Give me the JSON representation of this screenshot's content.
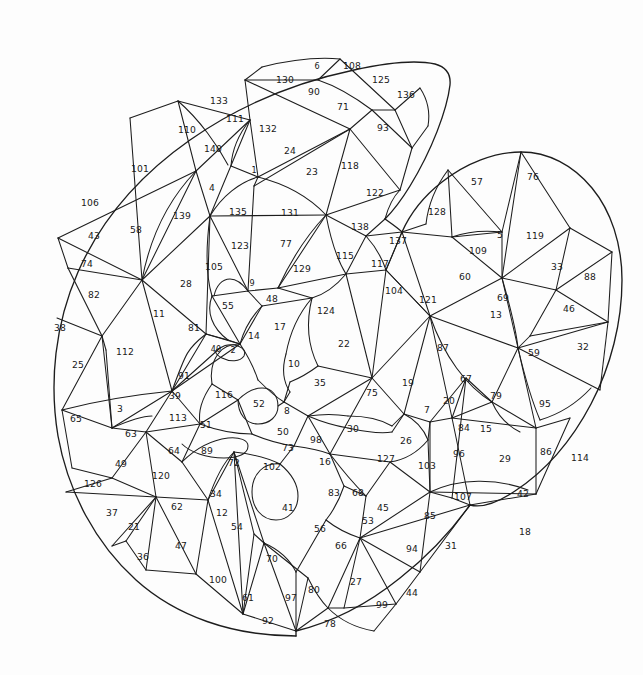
{
  "page": {
    "width": 643,
    "height": 675,
    "background_color": "#fdfdfd",
    "line_color": "#1d1d1d",
    "label_color": "#181818",
    "region_count": 140
  },
  "chart_data": {
    "type": "diagram",
    "xlabel": "",
    "ylabel": "",
    "grid": false,
    "legend": "none",
    "numbers_min": 1,
    "numbers_max": 140,
    "numbers_total": 140
  },
  "regions": [
    {
      "n": "6",
      "x": 317,
      "y": 66,
      "size": "sm"
    },
    {
      "n": "108",
      "x": 352,
      "y": 66,
      "size": ""
    },
    {
      "n": "130",
      "x": 285,
      "y": 80,
      "size": ""
    },
    {
      "n": "125",
      "x": 381,
      "y": 80,
      "size": ""
    },
    {
      "n": "90",
      "x": 314,
      "y": 92,
      "size": ""
    },
    {
      "n": "136",
      "x": 406,
      "y": 95,
      "size": ""
    },
    {
      "n": "133",
      "x": 219,
      "y": 101,
      "size": ""
    },
    {
      "n": "71",
      "x": 343,
      "y": 107,
      "size": ""
    },
    {
      "n": "111",
      "x": 235,
      "y": 119,
      "size": ""
    },
    {
      "n": "132",
      "x": 268,
      "y": 129,
      "size": ""
    },
    {
      "n": "110",
      "x": 187,
      "y": 130,
      "size": ""
    },
    {
      "n": "93",
      "x": 383,
      "y": 128,
      "size": ""
    },
    {
      "n": "140",
      "x": 213,
      "y": 149,
      "size": ""
    },
    {
      "n": "24",
      "x": 290,
      "y": 151,
      "size": ""
    },
    {
      "n": "101",
      "x": 140,
      "y": 169,
      "size": ""
    },
    {
      "n": "23",
      "x": 312,
      "y": 172,
      "size": ""
    },
    {
      "n": "118",
      "x": 350,
      "y": 166,
      "size": ""
    },
    {
      "n": "1",
      "x": 254,
      "y": 170,
      "size": "sm"
    },
    {
      "n": "57",
      "x": 477,
      "y": 182,
      "size": ""
    },
    {
      "n": "76",
      "x": 533,
      "y": 177,
      "size": ""
    },
    {
      "n": "4",
      "x": 212,
      "y": 188,
      "size": ""
    },
    {
      "n": "106",
      "x": 90,
      "y": 203,
      "size": ""
    },
    {
      "n": "122",
      "x": 375,
      "y": 193,
      "size": ""
    },
    {
      "n": "128",
      "x": 437,
      "y": 212,
      "size": ""
    },
    {
      "n": "139",
      "x": 182,
      "y": 216,
      "size": ""
    },
    {
      "n": "135",
      "x": 238,
      "y": 212,
      "size": ""
    },
    {
      "n": "131",
      "x": 290,
      "y": 213,
      "size": ""
    },
    {
      "n": "43",
      "x": 94,
      "y": 236,
      "size": ""
    },
    {
      "n": "58",
      "x": 136,
      "y": 230,
      "size": ""
    },
    {
      "n": "138",
      "x": 360,
      "y": 227,
      "size": ""
    },
    {
      "n": "5",
      "x": 500,
      "y": 235,
      "size": ""
    },
    {
      "n": "119",
      "x": 535,
      "y": 236,
      "size": ""
    },
    {
      "n": "137",
      "x": 398,
      "y": 241,
      "size": ""
    },
    {
      "n": "123",
      "x": 240,
      "y": 246,
      "size": ""
    },
    {
      "n": "77",
      "x": 286,
      "y": 244,
      "size": ""
    },
    {
      "n": "109",
      "x": 478,
      "y": 251,
      "size": ""
    },
    {
      "n": "74",
      "x": 87,
      "y": 264,
      "size": ""
    },
    {
      "n": "117",
      "x": 380,
      "y": 264,
      "size": ""
    },
    {
      "n": "115",
      "x": 345,
      "y": 256,
      "size": ""
    },
    {
      "n": "129",
      "x": 302,
      "y": 269,
      "size": ""
    },
    {
      "n": "33",
      "x": 557,
      "y": 267,
      "size": ""
    },
    {
      "n": "88",
      "x": 590,
      "y": 277,
      "size": ""
    },
    {
      "n": "105",
      "x": 214,
      "y": 267,
      "size": ""
    },
    {
      "n": "28",
      "x": 186,
      "y": 284,
      "size": ""
    },
    {
      "n": "60",
      "x": 465,
      "y": 277,
      "size": ""
    },
    {
      "n": "9",
      "x": 252,
      "y": 283,
      "size": "sm"
    },
    {
      "n": "82",
      "x": 94,
      "y": 295,
      "size": ""
    },
    {
      "n": "104",
      "x": 394,
      "y": 291,
      "size": ""
    },
    {
      "n": "121",
      "x": 428,
      "y": 300,
      "size": ""
    },
    {
      "n": "69",
      "x": 503,
      "y": 298,
      "size": ""
    },
    {
      "n": "46",
      "x": 569,
      "y": 309,
      "size": ""
    },
    {
      "n": "48",
      "x": 272,
      "y": 299,
      "size": ""
    },
    {
      "n": "55",
      "x": 228,
      "y": 306,
      "size": ""
    },
    {
      "n": "11",
      "x": 159,
      "y": 314,
      "size": ""
    },
    {
      "n": "124",
      "x": 326,
      "y": 311,
      "size": ""
    },
    {
      "n": "13",
      "x": 496,
      "y": 315,
      "size": ""
    },
    {
      "n": "38",
      "x": 60,
      "y": 328,
      "size": ""
    },
    {
      "n": "81",
      "x": 194,
      "y": 328,
      "size": ""
    },
    {
      "n": "17",
      "x": 280,
      "y": 327,
      "size": ""
    },
    {
      "n": "14",
      "x": 254,
      "y": 336,
      "size": ""
    },
    {
      "n": "32",
      "x": 583,
      "y": 347,
      "size": ""
    },
    {
      "n": "22",
      "x": 344,
      "y": 344,
      "size": ""
    },
    {
      "n": "87",
      "x": 443,
      "y": 348,
      "size": ""
    },
    {
      "n": "59",
      "x": 534,
      "y": 353,
      "size": ""
    },
    {
      "n": "112",
      "x": 125,
      "y": 352,
      "size": ""
    },
    {
      "n": "40",
      "x": 216,
      "y": 349,
      "size": "sm"
    },
    {
      "n": "2",
      "x": 233,
      "y": 350,
      "size": "sm"
    },
    {
      "n": "25",
      "x": 78,
      "y": 365,
      "size": ""
    },
    {
      "n": "10",
      "x": 294,
      "y": 364,
      "size": ""
    },
    {
      "n": "91",
      "x": 184,
      "y": 376,
      "size": ""
    },
    {
      "n": "35",
      "x": 320,
      "y": 383,
      "size": ""
    },
    {
      "n": "19",
      "x": 408,
      "y": 383,
      "size": ""
    },
    {
      "n": "67",
      "x": 466,
      "y": 379,
      "size": ""
    },
    {
      "n": "39",
      "x": 175,
      "y": 396,
      "size": ""
    },
    {
      "n": "116",
      "x": 224,
      "y": 395,
      "size": ""
    },
    {
      "n": "75",
      "x": 372,
      "y": 393,
      "size": ""
    },
    {
      "n": "20",
      "x": 449,
      "y": 401,
      "size": ""
    },
    {
      "n": "79",
      "x": 496,
      "y": 396,
      "size": ""
    },
    {
      "n": "95",
      "x": 545,
      "y": 404,
      "size": ""
    },
    {
      "n": "65",
      "x": 76,
      "y": 419,
      "size": ""
    },
    {
      "n": "3",
      "x": 120,
      "y": 409,
      "size": ""
    },
    {
      "n": "52",
      "x": 259,
      "y": 404,
      "size": ""
    },
    {
      "n": "8",
      "x": 287,
      "y": 411,
      "size": ""
    },
    {
      "n": "7",
      "x": 427,
      "y": 410,
      "size": ""
    },
    {
      "n": "113",
      "x": 178,
      "y": 418,
      "size": ""
    },
    {
      "n": "51",
      "x": 206,
      "y": 425,
      "size": ""
    },
    {
      "n": "50",
      "x": 283,
      "y": 432,
      "size": ""
    },
    {
      "n": "30",
      "x": 353,
      "y": 429,
      "size": ""
    },
    {
      "n": "84",
      "x": 464,
      "y": 428,
      "size": ""
    },
    {
      "n": "15",
      "x": 486,
      "y": 429,
      "size": ""
    },
    {
      "n": "63",
      "x": 131,
      "y": 434,
      "size": ""
    },
    {
      "n": "98",
      "x": 316,
      "y": 440,
      "size": ""
    },
    {
      "n": "73",
      "x": 288,
      "y": 448,
      "size": ""
    },
    {
      "n": "26",
      "x": 406,
      "y": 441,
      "size": ""
    },
    {
      "n": "86",
      "x": 546,
      "y": 452,
      "size": ""
    },
    {
      "n": "114",
      "x": 580,
      "y": 458,
      "size": ""
    },
    {
      "n": "49",
      "x": 121,
      "y": 464,
      "size": ""
    },
    {
      "n": "89",
      "x": 207,
      "y": 451,
      "size": ""
    },
    {
      "n": "96",
      "x": 459,
      "y": 454,
      "size": ""
    },
    {
      "n": "29",
      "x": 505,
      "y": 459,
      "size": ""
    },
    {
      "n": "64",
      "x": 174,
      "y": 451,
      "size": ""
    },
    {
      "n": "72",
      "x": 234,
      "y": 463,
      "size": ""
    },
    {
      "n": "102",
      "x": 272,
      "y": 467,
      "size": ""
    },
    {
      "n": "16",
      "x": 325,
      "y": 462,
      "size": ""
    },
    {
      "n": "127",
      "x": 386,
      "y": 459,
      "size": ""
    },
    {
      "n": "103",
      "x": 427,
      "y": 466,
      "size": ""
    },
    {
      "n": "126",
      "x": 93,
      "y": 484,
      "size": ""
    },
    {
      "n": "120",
      "x": 161,
      "y": 476,
      "size": ""
    },
    {
      "n": "34",
      "x": 216,
      "y": 494,
      "size": ""
    },
    {
      "n": "83",
      "x": 334,
      "y": 493,
      "size": ""
    },
    {
      "n": "68",
      "x": 358,
      "y": 493,
      "size": ""
    },
    {
      "n": "45",
      "x": 383,
      "y": 508,
      "size": ""
    },
    {
      "n": "107",
      "x": 463,
      "y": 497,
      "size": ""
    },
    {
      "n": "42",
      "x": 523,
      "y": 494,
      "size": ""
    },
    {
      "n": "37",
      "x": 112,
      "y": 513,
      "size": ""
    },
    {
      "n": "62",
      "x": 177,
      "y": 507,
      "size": ""
    },
    {
      "n": "12",
      "x": 222,
      "y": 513,
      "size": ""
    },
    {
      "n": "41",
      "x": 288,
      "y": 508,
      "size": ""
    },
    {
      "n": "53",
      "x": 368,
      "y": 521,
      "size": ""
    },
    {
      "n": "85",
      "x": 430,
      "y": 516,
      "size": ""
    },
    {
      "n": "18",
      "x": 525,
      "y": 532,
      "size": ""
    },
    {
      "n": "21",
      "x": 134,
      "y": 527,
      "size": ""
    },
    {
      "n": "54",
      "x": 237,
      "y": 527,
      "size": ""
    },
    {
      "n": "56",
      "x": 320,
      "y": 529,
      "size": ""
    },
    {
      "n": "66",
      "x": 341,
      "y": 546,
      "size": ""
    },
    {
      "n": "94",
      "x": 412,
      "y": 549,
      "size": ""
    },
    {
      "n": "31",
      "x": 451,
      "y": 546,
      "size": ""
    },
    {
      "n": "36",
      "x": 143,
      "y": 557,
      "size": ""
    },
    {
      "n": "47",
      "x": 181,
      "y": 546,
      "size": ""
    },
    {
      "n": "70",
      "x": 272,
      "y": 559,
      "size": ""
    },
    {
      "n": "27",
      "x": 356,
      "y": 582,
      "size": ""
    },
    {
      "n": "44",
      "x": 412,
      "y": 593,
      "size": ""
    },
    {
      "n": "100",
      "x": 218,
      "y": 580,
      "size": ""
    },
    {
      "n": "80",
      "x": 314,
      "y": 590,
      "size": ""
    },
    {
      "n": "61",
      "x": 248,
      "y": 598,
      "size": ""
    },
    {
      "n": "97",
      "x": 291,
      "y": 598,
      "size": ""
    },
    {
      "n": "99",
      "x": 382,
      "y": 605,
      "size": ""
    },
    {
      "n": "92",
      "x": 268,
      "y": 621,
      "size": ""
    },
    {
      "n": "78",
      "x": 330,
      "y": 624,
      "size": ""
    }
  ]
}
